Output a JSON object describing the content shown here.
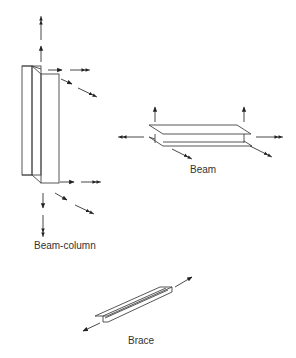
{
  "diagram": {
    "title": "",
    "members": [
      {
        "id": "beam-column",
        "label": "Beam-column",
        "description": "Vertical wide-flange member with axial, transverse and moment arrows at both ends"
      },
      {
        "id": "beam",
        "label": "Beam",
        "description": "Horizontal wide-flange member with transverse arrows up and axial/moment arrows at ends"
      },
      {
        "id": "brace",
        "label": "Brace",
        "description": "Diagonal tee member with axial arrows at both ends"
      }
    ],
    "colors": {
      "line": "#444444",
      "arrow": "#222222",
      "text": "#333333",
      "background": "#ffffff"
    }
  }
}
